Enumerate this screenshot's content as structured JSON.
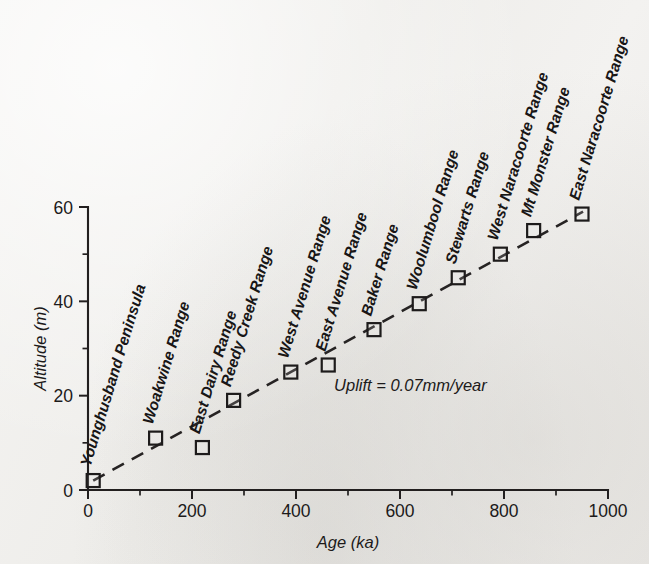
{
  "chart_data": {
    "type": "scatter",
    "title": "",
    "xlabel": "Age (ka)",
    "ylabel": "Altitude (m)",
    "xlim": [
      0,
      1000
    ],
    "ylim": [
      0,
      60
    ],
    "grid": false,
    "legend_position": "none",
    "x_major_ticks": [
      0,
      200,
      400,
      600,
      800,
      1000
    ],
    "x_minor_ticks": [
      100,
      300,
      500,
      700,
      900
    ],
    "x_tick_labels": [
      "0",
      "200",
      "400",
      "600",
      "800",
      "1000"
    ],
    "y_major_ticks": [
      0,
      20,
      40,
      60
    ],
    "y_minor_ticks": [
      10,
      30,
      50
    ],
    "y_tick_labels": [
      "0",
      "20",
      "40",
      "60"
    ],
    "marker_style": "open-square",
    "annotations": [
      {
        "text": "Uplift = 0.07mm/year",
        "x": 620,
        "y": 21
      }
    ],
    "trend_line": {
      "style": "dashed",
      "x": [
        10,
        952
      ],
      "y": [
        2,
        59
      ]
    },
    "points": [
      {
        "label": "Younghusband Peninsula",
        "x": 10,
        "y": 2
      },
      {
        "label": "Woakwine Range",
        "x": 130,
        "y": 11
      },
      {
        "label": "East Dairy Range",
        "x": 220,
        "y": 9
      },
      {
        "label": "Reedy Creek Range",
        "x": 280,
        "y": 19
      },
      {
        "label": "West Avenue Range",
        "x": 390,
        "y": 25
      },
      {
        "label": "East Avenue Range",
        "x": 462,
        "y": 26.5
      },
      {
        "label": "Baker Range",
        "x": 550,
        "y": 34
      },
      {
        "label": "Woolumbool Range",
        "x": 637,
        "y": 39.5
      },
      {
        "label": "Stewarts Range",
        "x": 712,
        "y": 45
      },
      {
        "label": "West Naracoorte Range",
        "x": 793,
        "y": 50
      },
      {
        "label": "Mt Monster Range",
        "x": 857,
        "y": 55
      },
      {
        "label": "East Naracoorte Range",
        "x": 950,
        "y": 58.5
      }
    ]
  },
  "axis": {
    "x_title": "Age (ka)",
    "y_title": "Altitude (m)"
  }
}
